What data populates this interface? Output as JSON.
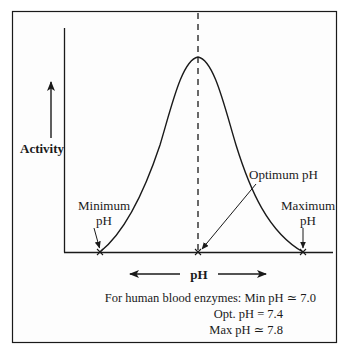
{
  "diagram": {
    "axis_y_label": "Activity",
    "axis_x_label": "pH",
    "labels": {
      "minimum_line1": "Minimum",
      "minimum_line2": "pH",
      "optimum": "Optimum pH",
      "maximum_line1": "Maximum",
      "maximum_line2": "pH"
    },
    "note": {
      "line1": "For human blood enzymes: Min pH ≃ 7.0",
      "line2": "Opt. pH = 7.4",
      "line3": "Max pH ≃ 7.8"
    },
    "values": {
      "min_ph": "7.0",
      "opt_ph": "7.4",
      "max_ph": "7.8"
    },
    "colors": {
      "stroke": "#1a1a1a",
      "background": "#ffffff",
      "frame_bg": "#fdfdfd"
    }
  }
}
